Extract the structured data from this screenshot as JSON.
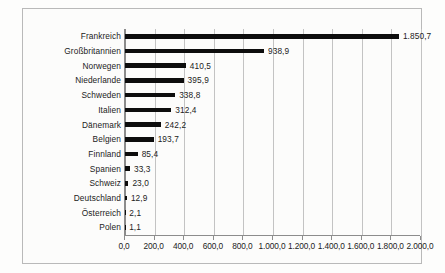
{
  "chart_data": {
    "type": "bar",
    "orientation": "horizontal",
    "title": "",
    "subtitle": "",
    "xlabel": "",
    "ylabel": "",
    "grid": true,
    "legend": false,
    "xlim": [
      0,
      2000
    ],
    "xticks": [
      "0,0",
      "200,0",
      "400,0",
      "600,0",
      "800,0",
      "1.000,0",
      "1.200,0",
      "1.400,0",
      "1.600,0",
      "1.800,0",
      "2.000,0"
    ],
    "xtick_values": [
      0,
      200,
      400,
      600,
      800,
      1000,
      1200,
      1400,
      1600,
      1800,
      2000
    ],
    "categories": [
      "Frankreich",
      "Großbritannien",
      "Norwegen",
      "Niederlande",
      "Schweden",
      "Italien",
      "Dänemark",
      "Belgien",
      "Finnland",
      "Spanien",
      "Schweiz",
      "Deutschland",
      "Österreich",
      "Polen"
    ],
    "values": [
      1850.7,
      938.9,
      410.5,
      395.9,
      338.8,
      312.4,
      242.2,
      193.7,
      85.4,
      33.3,
      23.0,
      12.9,
      2.1,
      1.1
    ],
    "value_labels": [
      "1.850,7",
      "938,9",
      "410,5",
      "395,9",
      "338,8",
      "312,4",
      "242,2",
      "193,7",
      "85,4",
      "33,3",
      "23,0",
      "12,9",
      "2,1",
      "1,1"
    ],
    "bar_color": "#0d0d0d",
    "grid_color": "#c3c3c3",
    "axis_color": "#8c8c8c",
    "background_color": "#fcfcfb"
  }
}
